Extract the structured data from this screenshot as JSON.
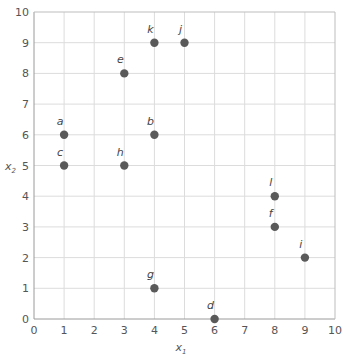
{
  "chart_data": {
    "type": "scatter",
    "title": "",
    "xlabel": "x1",
    "ylabel": "x2",
    "xlim": [
      0,
      10
    ],
    "ylim": [
      0,
      10
    ],
    "x_ticks": [
      0,
      1,
      2,
      3,
      4,
      5,
      6,
      7,
      8,
      9,
      10
    ],
    "y_ticks": [
      0,
      1,
      2,
      3,
      4,
      5,
      6,
      7,
      8,
      9,
      10
    ],
    "grid": true,
    "legend": null,
    "marker_color": "#5a5a5a",
    "points": [
      {
        "label": "a",
        "x": 1,
        "y": 6
      },
      {
        "label": "b",
        "x": 4,
        "y": 6
      },
      {
        "label": "c",
        "x": 1,
        "y": 5
      },
      {
        "label": "d",
        "x": 6,
        "y": 0
      },
      {
        "label": "e",
        "x": 3,
        "y": 8
      },
      {
        "label": "f",
        "x": 8,
        "y": 3
      },
      {
        "label": "g",
        "x": 4,
        "y": 1
      },
      {
        "label": "h",
        "x": 3,
        "y": 5
      },
      {
        "label": "i",
        "x": 9,
        "y": 2
      },
      {
        "label": "j",
        "x": 5,
        "y": 9
      },
      {
        "label": "k",
        "x": 4,
        "y": 9
      },
      {
        "label": "l",
        "x": 8,
        "y": 4
      }
    ]
  },
  "axes": {
    "x_label_main": "x",
    "x_label_sub": "1",
    "y_label_main": "x",
    "y_label_sub": "2"
  }
}
